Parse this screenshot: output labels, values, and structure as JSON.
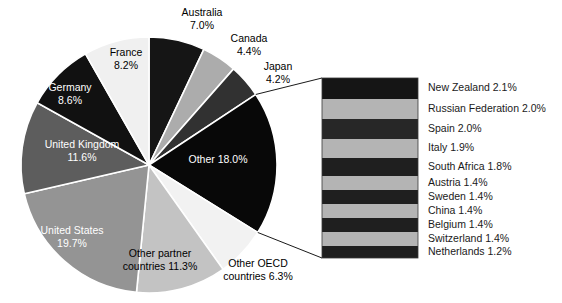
{
  "chart_data": {
    "type": "pie",
    "title": "",
    "subtitle": "",
    "xlabel": "",
    "ylabel": "",
    "legend_position": "callout-right",
    "grid": false,
    "units": "percent",
    "categories": [
      "Australia",
      "Canada",
      "Japan",
      "Other",
      "Other OECD countries",
      "Other partner countries",
      "United States",
      "United Kingdom",
      "Germany",
      "France"
    ],
    "values": [
      7.0,
      4.4,
      4.2,
      18.0,
      6.3,
      11.3,
      19.7,
      11.6,
      8.6,
      8.2
    ],
    "slices": [
      {
        "label": "Australia",
        "value": 7.0,
        "value_text": "7.0%",
        "color": "#151515",
        "label_placement": "outside",
        "label_lines": [
          "Australia",
          "7.0%"
        ]
      },
      {
        "label": "Canada",
        "value": 4.4,
        "value_text": "4.4%",
        "color": "#acacac",
        "label_placement": "outside",
        "label_lines": [
          "Canada",
          "4.4%"
        ]
      },
      {
        "label": "Japan",
        "value": 4.2,
        "value_text": "4.2%",
        "color": "#313131",
        "label_placement": "outside",
        "label_lines": [
          "Japan",
          "4.2%"
        ]
      },
      {
        "label": "Other",
        "value": 18.0,
        "value_text": "18.0%",
        "color": "#080808",
        "label_placement": "inside",
        "label_lines": [
          "Other 18.0%"
        ]
      },
      {
        "label": "Other OECD countries",
        "value": 6.3,
        "value_text": "6.3%",
        "color": "#f2f2f2",
        "label_placement": "outside",
        "label_lines": [
          "Other OECD",
          "countries 6.3%"
        ]
      },
      {
        "label": "Other partner countries",
        "value": 11.3,
        "value_text": "11.3%",
        "color": "#c3c3c3",
        "label_placement": "outside",
        "label_lines": [
          "Other partner",
          "countries 11.3%"
        ]
      },
      {
        "label": "United States",
        "value": 19.7,
        "value_text": "19.7%",
        "color": "#949494",
        "label_placement": "inside",
        "label_lines": [
          "United States",
          "19.7%"
        ]
      },
      {
        "label": "United Kingdom",
        "value": 11.6,
        "value_text": "11.6%",
        "color": "#5d5d5d",
        "label_placement": "inside",
        "label_lines": [
          "United Kingdom",
          "11.6%"
        ]
      },
      {
        "label": "Germany",
        "value": 8.6,
        "value_text": "8.6%",
        "color": "#111111",
        "label_placement": "inside",
        "label_lines": [
          "Germany",
          "8.6%"
        ]
      },
      {
        "label": "France",
        "value": 8.2,
        "value_text": "8.2%",
        "color": "#f0f0f0",
        "label_placement": "inside",
        "label_lines": [
          "France",
          "8.2%"
        ]
      }
    ],
    "callout": {
      "source_slice": "Other",
      "source_value": 18.0,
      "type": "stacked-bar",
      "items": [
        {
          "label": "New Zealand",
          "value": 2.1,
          "text": "New Zealand 2.1%",
          "color": "#151515"
        },
        {
          "label": "Russian Federation",
          "value": 2.0,
          "text": "Russian Federation 2.0%",
          "color": "#b4b4b4"
        },
        {
          "label": "Spain",
          "value": 2.0,
          "text": "Spain 2.0%",
          "color": "#272727"
        },
        {
          "label": "Italy",
          "value": 1.9,
          "text": "Italy 1.9%",
          "color": "#b4b4b4"
        },
        {
          "label": "South Africa",
          "value": 1.8,
          "text": "South Africa 1.8%",
          "color": "#1f1f1f"
        },
        {
          "label": "Austria",
          "value": 1.4,
          "text": "Austria 1.4%",
          "color": "#b4b4b4"
        },
        {
          "label": "Sweden",
          "value": 1.4,
          "text": "Sweden 1.4%",
          "color": "#1f1f1f"
        },
        {
          "label": "China",
          "value": 1.4,
          "text": "China 1.4%",
          "color": "#b4b4b4"
        },
        {
          "label": "Belgium",
          "value": 1.4,
          "text": "Belgium 1.4%",
          "color": "#1f1f1f"
        },
        {
          "label": "Switzerland",
          "value": 1.4,
          "text": "Switzerland 1.4%",
          "color": "#b4b4b4"
        },
        {
          "label": "Netherlands",
          "value": 1.2,
          "text": "Netherlands 1.2%",
          "color": "#1f1f1f"
        }
      ]
    },
    "colors": {
      "background": "#ffffff",
      "text": "#000000",
      "text_on_dark": "#ffffff",
      "leader_line": "#1a1a1a"
    }
  }
}
